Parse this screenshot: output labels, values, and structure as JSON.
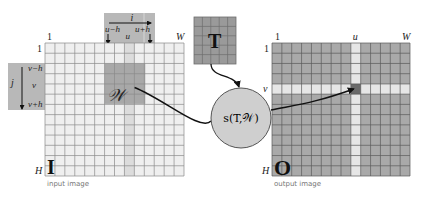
{
  "colors": {
    "background": "#ffffff",
    "input_cell": "#efefef",
    "input_grid_line": "#8a8a8a",
    "input_column_strip": "#dcdcdc",
    "window_fill": "#a8a8a8",
    "label_bar_fill": "#b8b8b8",
    "template_fill": "#9a9a9a",
    "template_line": "#6e6e6e",
    "output_cell": "#a9a9a9",
    "output_grid_line": "#5a5a5a",
    "output_highlight": "#e6e6e6",
    "output_target_cell": "#6a6a6a",
    "circle_fill": "#cfcfcf",
    "circle_stroke": "#555555",
    "arrow": "#111111"
  },
  "input_image": {
    "caption": "input image",
    "symbol": "I",
    "x": 45,
    "y": 43,
    "w": 139,
    "h": 133,
    "cols": 14,
    "rows": 13,
    "top_left_label": "1",
    "top_right_label": "W",
    "left_top_label": "1",
    "left_bottom_label": "H",
    "column_strip_index": 8,
    "window": {
      "col_start": 6,
      "col_end": 10,
      "row_start": 2,
      "row_end": 6,
      "label": "𝒲"
    }
  },
  "column_bar": {
    "x": 104,
    "y": 13,
    "w": 51,
    "h": 30,
    "axis_label": "i",
    "left_label": "u−h",
    "center_label": "u",
    "right_label": "u+h"
  },
  "row_bar": {
    "x": 8,
    "y": 63,
    "w": 37,
    "h": 47,
    "axis_label": "j",
    "top_label": "v−h",
    "center_label": "v",
    "bottom_label": "v+h"
  },
  "template": {
    "symbol": "T",
    "x": 194,
    "y": 17,
    "w": 42,
    "h": 47,
    "cols": 5,
    "rows": 5
  },
  "similarity": {
    "label": "s(T,𝒲)",
    "cx": 241,
    "cy": 118,
    "r": 30
  },
  "output_image": {
    "caption": "output image",
    "symbol": "O",
    "x": 272,
    "y": 43,
    "w": 138,
    "h": 133,
    "cols": 14,
    "rows": 13,
    "top_left_label": "1",
    "top_u_label": "u",
    "top_right_label": "W",
    "left_top_label": "1",
    "left_v_label": "v",
    "left_bottom_label": "H",
    "highlight_col": 8,
    "highlight_row": 4
  }
}
